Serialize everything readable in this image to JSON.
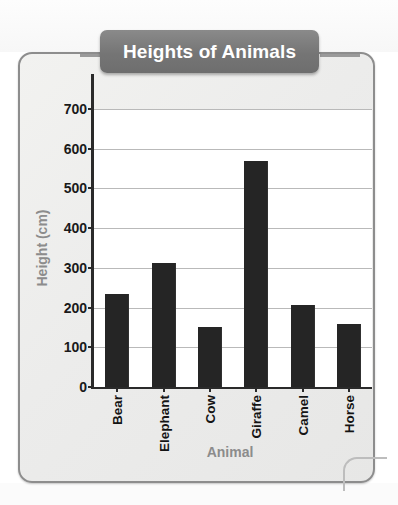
{
  "chart_data": {
    "type": "bar",
    "title": "Heights of Animals",
    "xlabel": "Animal",
    "ylabel": "Height (cm)",
    "categories": [
      "Bear",
      "Elephant",
      "Cow",
      "Giraffe",
      "Camel",
      "Horse"
    ],
    "values": [
      235,
      313,
      152,
      568,
      207,
      158
    ],
    "ylim": [
      0,
      700
    ],
    "ytick_values": [
      0,
      100,
      200,
      300,
      400,
      500,
      600,
      700
    ],
    "ytick_labels": [
      "0",
      "100",
      "200",
      "300",
      "400",
      "500",
      "600",
      "700"
    ],
    "grid": true,
    "legend": null,
    "bar_color": "#252525",
    "title_background_color": "#757575",
    "title_text_color": "#ffffff",
    "axis_label_color": "#8c8c8c",
    "gridline_color": "#b9b9b9",
    "axis_color": "#2a2a2a",
    "card_background_color": "#ececeb",
    "card_border_color": "#8d8d8d"
  }
}
